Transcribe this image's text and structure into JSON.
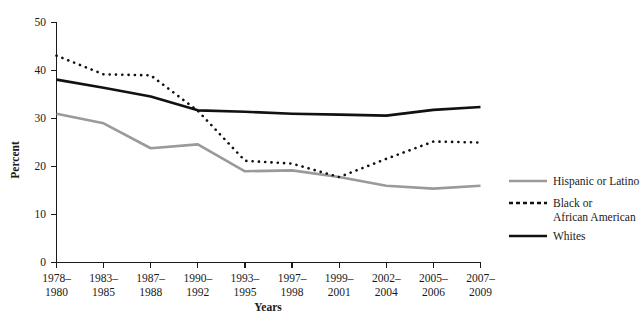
{
  "chart_data": {
    "type": "line",
    "title": "",
    "xlabel": "Years",
    "ylabel": "Percent",
    "ylim": [
      0,
      50
    ],
    "yticks": [
      0,
      10,
      20,
      30,
      40,
      50
    ],
    "grid": false,
    "legend_position": "right",
    "categories": [
      "1978–\n1980",
      "1983–\n1985",
      "1987–\n1988",
      "1990–\n1992",
      "1993–\n1995",
      "1997–\n1998",
      "1999–\n2001",
      "2002–\n2004",
      "2005–\n2006",
      "2007–\n2009"
    ],
    "categories_line1": [
      "1978–",
      "1983–",
      "1987–",
      "1990–",
      "1993–",
      "1997–",
      "1999–",
      "2002–",
      "2005–",
      "2007–"
    ],
    "categories_line2": [
      "1980",
      "1985",
      "1988",
      "1992",
      "1995",
      "1998",
      "2001",
      "2004",
      "2006",
      "2009"
    ],
    "series": [
      {
        "name": "Hispanic or Latino",
        "style": "solid",
        "color": "#9a9a9a",
        "width": 2.6,
        "values": [
          31.0,
          29.0,
          23.8,
          24.6,
          19.0,
          19.2,
          17.8,
          16.0,
          15.4,
          16.0
        ]
      },
      {
        "name": "Black or African American",
        "style": "dotted",
        "color": "#111111",
        "width": 2.6,
        "values": [
          43.1,
          39.2,
          39.0,
          31.6,
          21.2,
          20.6,
          17.8,
          21.6,
          25.2,
          25.0
        ]
      },
      {
        "name": "Whites",
        "style": "solid",
        "color": "#111111",
        "width": 2.6,
        "values": [
          38.1,
          36.4,
          34.6,
          31.7,
          31.4,
          31.0,
          30.8,
          30.6,
          31.8,
          32.4
        ]
      }
    ]
  },
  "legend": {
    "items": [
      {
        "label": "Hispanic or Latino",
        "label_line2": ""
      },
      {
        "label": "Black or",
        "label_line2": "African American"
      },
      {
        "label": "Whites",
        "label_line2": ""
      }
    ]
  },
  "axis": {
    "y_title": "Percent",
    "x_title": "Years",
    "y_tick_0": "0",
    "y_tick_10": "10",
    "y_tick_20": "20",
    "y_tick_30": "30",
    "y_tick_40": "40",
    "y_tick_50": "50"
  }
}
